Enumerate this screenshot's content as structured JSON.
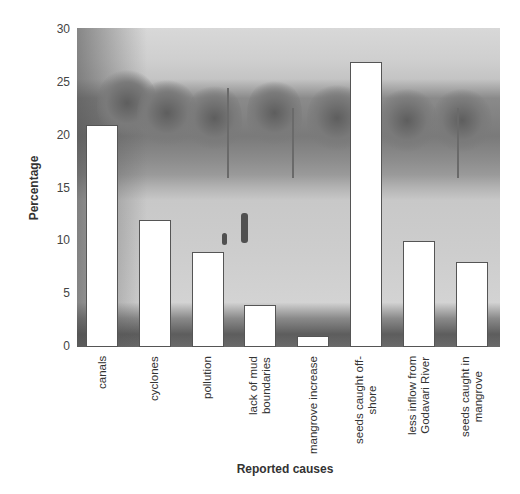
{
  "chart_data": {
    "type": "bar",
    "title": "",
    "xlabel": "Reported causes",
    "ylabel": "Percentage",
    "ylim": [
      0,
      30
    ],
    "yticks": [
      0,
      5,
      10,
      15,
      20,
      25,
      30
    ],
    "grid": false,
    "legend": null,
    "background": "photograph of palm trees and a flooded field with people (grayscale)",
    "categories": [
      "canals",
      "cyclones",
      "pollution",
      "lack of mud boundaries",
      "mangrove increase",
      "seeds caught off-shore",
      "less inflow from Godavari River",
      "seeds caught in mangrove"
    ],
    "category_label_lines": [
      "canals",
      "cyclones",
      "pollution",
      "lack of mud\nboundaries",
      "mangrove increase",
      "seeds caught off-\nshore",
      "less inflow from\nGodavari River",
      "seeds caught in\nmangrove"
    ],
    "values": [
      21,
      12,
      9,
      4,
      1,
      27,
      10,
      8
    ],
    "bar_color": "#ffffff",
    "bar_edge_color": "#555555"
  },
  "axis": {
    "y_ticks": [
      "0",
      "5",
      "10",
      "15",
      "20",
      "25",
      "30"
    ],
    "y_title": "Percentage",
    "x_title": "Reported causes"
  }
}
